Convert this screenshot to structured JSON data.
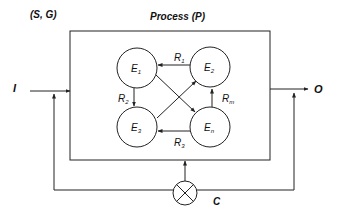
{
  "diagram": {
    "system_label": "(S, G)",
    "process_title": "Process (P)",
    "input_label": "I",
    "output_label": "O",
    "control_label": "C",
    "nodes": [
      {
        "id": "E1",
        "base": "E",
        "sub": "1"
      },
      {
        "id": "E2",
        "base": "E",
        "sub": "2"
      },
      {
        "id": "E3",
        "base": "E",
        "sub": "3"
      },
      {
        "id": "En",
        "base": "E",
        "sub": "n"
      }
    ],
    "relations": [
      {
        "id": "R1",
        "base": "R",
        "sub": "1",
        "from": "E2",
        "to": "E1"
      },
      {
        "id": "R2",
        "base": "R",
        "sub": "2",
        "from": "E1",
        "to": "E3"
      },
      {
        "id": "R3",
        "base": "R",
        "sub": "3",
        "from": "En",
        "to": "E3"
      },
      {
        "id": "Rm",
        "base": "R",
        "sub": "m",
        "from": "En",
        "to": "E2"
      }
    ],
    "unlabeled_edges": [
      {
        "from": "E1",
        "to": "En"
      },
      {
        "from": "E3",
        "to": "E2"
      }
    ],
    "colors": {
      "stroke": "#222222",
      "background": "#ffffff"
    }
  }
}
